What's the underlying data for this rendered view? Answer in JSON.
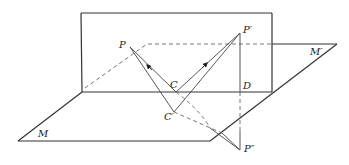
{
  "diagram": {
    "colors": {
      "stroke": "#333333",
      "thin": "#555555",
      "dashed": "#666666"
    },
    "planes": {
      "vertical": {
        "label": "M′",
        "corners": [
          [
            81,
            13
          ],
          [
            272,
            13
          ],
          [
            272,
            92
          ],
          [
            82,
            92
          ]
        ]
      },
      "horizontal": {
        "label": "M",
        "corners": [
          [
            18,
            141
          ],
          [
            210,
            141
          ],
          [
            337,
            44
          ],
          [
            272,
            44
          ]
        ]
      }
    },
    "points": {
      "P": {
        "label": "P",
        "x": 130,
        "y": 47
      },
      "P1": {
        "label": "P′",
        "x": 240,
        "y": 33
      },
      "C": {
        "label": "C",
        "x": 176,
        "y": 92
      },
      "C1": {
        "label": "C′",
        "x": 174,
        "y": 112
      },
      "D": {
        "label": "D",
        "x": 240,
        "y": 92
      },
      "P2": {
        "label": "P″",
        "x": 240,
        "y": 150
      }
    },
    "labels": {
      "P": "P",
      "P_prime": "P′",
      "C": "C",
      "C_prime": "C′",
      "D": "D",
      "P_double_prime": "P″",
      "M": "M",
      "M_prime": "M′"
    }
  }
}
